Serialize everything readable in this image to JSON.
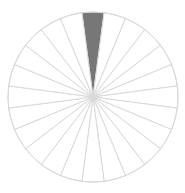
{
  "diagram": {
    "type": "sectored-circle",
    "center": [
      93,
      97
    ],
    "radius": 85,
    "sector_count": 24,
    "start_angle_deg": -7.5,
    "filled_sectors": [
      0
    ],
    "colors": {
      "background": "#ffffff",
      "outline": "#d9d9d9",
      "fill": "#777777"
    }
  }
}
